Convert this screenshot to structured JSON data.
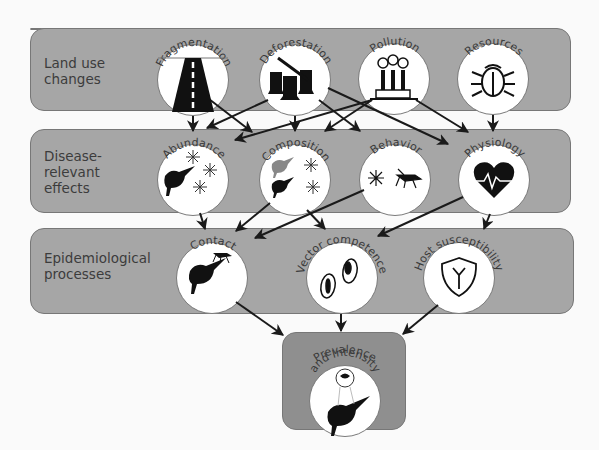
{
  "rows": [
    {
      "id": "land",
      "label": "Land use\nchanges"
    },
    {
      "id": "effects",
      "label": "Disease-\nrelevant\neffects"
    },
    {
      "id": "epi",
      "label": "Epidemiological\nprocesses"
    }
  ],
  "nodes": {
    "fragmentation": {
      "label": "Fragmentation",
      "icon": "road-icon"
    },
    "deforestation": {
      "label": "Deforestation",
      "icon": "tree-stumps-icon"
    },
    "pollution": {
      "label": "Pollution",
      "icon": "factory-icon"
    },
    "resources": {
      "label": "Resources",
      "icon": "beetle-icon"
    },
    "abundance": {
      "label": "Abundance",
      "icon": "bird-mosquitoes-icon"
    },
    "composition": {
      "label": "Composition",
      "icon": "birds-mosquitoes-icon"
    },
    "behavior": {
      "label": "Behavior",
      "icon": "mosquitoes-icon"
    },
    "physiology": {
      "label": "Physiology",
      "icon": "heartbeat-icon"
    },
    "contact": {
      "label": "Contact",
      "icon": "bird-mosquito-icon"
    },
    "vector_competence": {
      "label": "Vector competence",
      "icon": "parasite-cells-icon"
    },
    "host_susceptibility": {
      "label": "Host susceptibility",
      "icon": "antibody-shield-icon"
    },
    "prevalence": {
      "label1": "Prevalence",
      "label2": "and Intensity",
      "icon": "infected-bird-icon"
    }
  },
  "colors": {
    "panel": "#a6a6a6",
    "panel_dark": "#8f8f8f",
    "node_fill": "#ffffff",
    "arrow": "#1a1a1a",
    "text": "#3c3c3c"
  }
}
